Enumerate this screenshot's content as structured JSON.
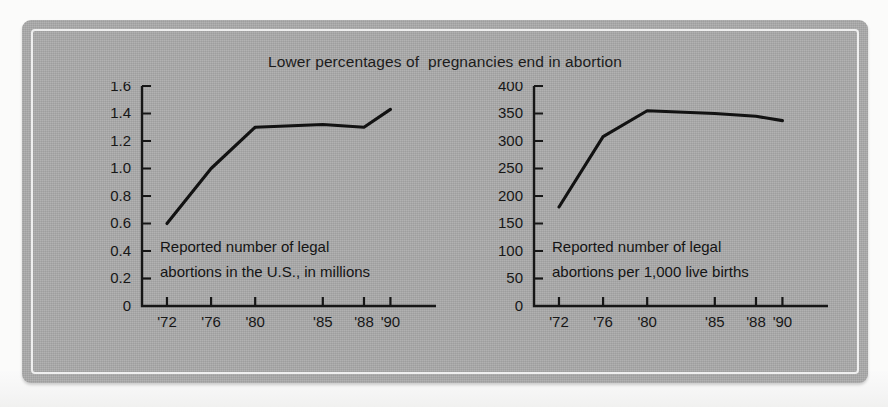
{
  "figure": {
    "title": "Lower percentages of  pregnancies end in abortion",
    "panel_color": "#ababab",
    "ink_color": "#161616",
    "border_color": "#efefef"
  },
  "chart_data": [
    {
      "type": "line",
      "id": "legal-abortions-millions",
      "title": "Lower percentages of  pregnancies end in abortion",
      "caption": [
        "Reported number of legal",
        "abortions in the U.S., in millions"
      ],
      "xlabel": "",
      "ylabel": "",
      "x": [
        "'72",
        "'76",
        "'80",
        "'85",
        "'88",
        "'90"
      ],
      "xtick_labels": [
        "'72",
        "'76",
        "'80",
        "'85",
        "'88",
        "'90"
      ],
      "values": [
        0.6,
        1.0,
        1.3,
        1.32,
        1.3,
        1.43
      ],
      "ytick_labels": [
        "1.6",
        "1.4",
        "1.2",
        "1.0",
        "0.8",
        "0.6",
        "0.4",
        "0.2",
        "0"
      ],
      "yticks": [
        1.6,
        1.4,
        1.2,
        1.0,
        0.8,
        0.6,
        0.4,
        0.2,
        0
      ],
      "ylim": [
        0,
        1.6
      ],
      "grid": false,
      "legend": "none"
    },
    {
      "type": "line",
      "id": "abortions-per-1000-live-births",
      "title": "Lower percentages of  pregnancies end in abortion",
      "caption": [
        "Reported number of legal",
        "abortions per 1,000 live births"
      ],
      "xlabel": "",
      "ylabel": "",
      "x": [
        "'72",
        "'76",
        "'80",
        "'85",
        "'88",
        "'90"
      ],
      "xtick_labels": [
        "'72",
        "'76",
        "'80",
        "'85",
        "'88",
        "'90"
      ],
      "values": [
        180,
        308,
        355,
        350,
        345,
        337
      ],
      "ytick_labels": [
        "400",
        "350",
        "300",
        "250",
        "200",
        "150",
        "100",
        "50",
        "0"
      ],
      "yticks": [
        400,
        350,
        300,
        250,
        200,
        150,
        100,
        50,
        0
      ],
      "ylim": [
        0,
        400
      ],
      "grid": false,
      "legend": "none"
    }
  ]
}
